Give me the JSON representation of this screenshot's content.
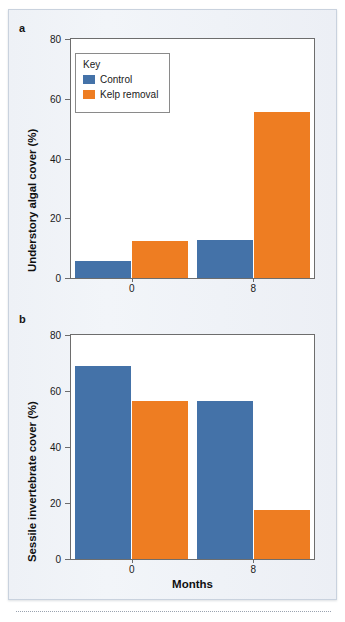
{
  "figure": {
    "panel_a_letter": "a",
    "panel_b_letter": "b",
    "x_axis_title": "Months",
    "legend_title": "Key",
    "series_names": [
      "Control",
      "Kelp removal"
    ],
    "colors": {
      "control": "#4472A8",
      "kelp_removal": "#EE7D22",
      "background": "#EEF1F6",
      "axis": "#6D6D6D",
      "text": "#1A1A1A"
    }
  },
  "chart_data": [
    {
      "type": "bar",
      "panel": "a",
      "title": "",
      "xlabel": "",
      "ylabel": "Understory algal cover (%)",
      "categories": [
        "0",
        "8"
      ],
      "xtick_labels": [
        "0",
        "8"
      ],
      "ytick_labels": [
        "0",
        "20",
        "40",
        "60",
        "80"
      ],
      "yticks": [
        0,
        20,
        40,
        60,
        80
      ],
      "ylim": [
        0,
        80
      ],
      "grid": false,
      "legend_position": "upper-left",
      "series": [
        {
          "name": "Control",
          "color": "#4472A8",
          "values": [
            5.7,
            12.7
          ]
        },
        {
          "name": "Kelp removal",
          "color": "#EE7D22",
          "values": [
            12.3,
            55.7
          ]
        }
      ]
    },
    {
      "type": "bar",
      "panel": "b",
      "title": "",
      "xlabel": "Months",
      "ylabel": "Sessile invertebrate cover (%)",
      "categories": [
        "0",
        "8"
      ],
      "xtick_labels": [
        "0",
        "8"
      ],
      "ytick_labels": [
        "0",
        "20",
        "40",
        "60",
        "80"
      ],
      "yticks": [
        0,
        20,
        40,
        60,
        80
      ],
      "ylim": [
        0,
        80
      ],
      "grid": false,
      "legend_position": "none",
      "series": [
        {
          "name": "Control",
          "color": "#4472A8",
          "values": [
            68.8,
            56.6
          ]
        },
        {
          "name": "Kelp removal",
          "color": "#EE7D22",
          "values": [
            56.3,
            17.5
          ]
        }
      ]
    }
  ]
}
